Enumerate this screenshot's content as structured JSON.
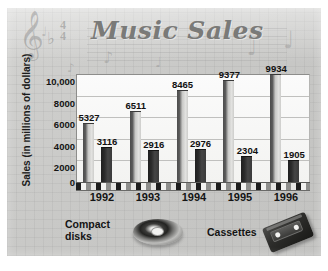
{
  "chart_data": {
    "type": "bar",
    "title": "Music Sales",
    "xlabel": "",
    "ylabel": "Sales (in millions of dollars)",
    "categories": [
      "1992",
      "1993",
      "1994",
      "1995",
      "1996"
    ],
    "series": [
      {
        "name": "Compact disks",
        "values": [
          5327,
          6511,
          8465,
          9377,
          9934
        ]
      },
      {
        "name": "Cassettes",
        "values": [
          3116,
          2916,
          2976,
          2304,
          1905
        ]
      }
    ],
    "ylim": [
      0,
      10000
    ],
    "yticks": [
      "10,000",
      "8000",
      "6000",
      "4000",
      "2000",
      "0"
    ],
    "ytick_values": [
      10000,
      8000,
      6000,
      4000,
      2000,
      0
    ],
    "grid": true,
    "legend_position": "bottom",
    "data_labels": true
  },
  "title_zone": {
    "title": "Music Sales",
    "clef_glyph": "𝄞",
    "flat_glyph": "♭",
    "time_signature_top": "4",
    "time_signature_bottom": "4",
    "decor_notes": [
      "♩",
      "♪",
      "♩",
      "♩",
      "♩",
      "♪"
    ]
  },
  "axis": {
    "y_title": "Sales (in millions of dollars)",
    "y_ticks": [
      "10,000",
      "8000",
      "6000",
      "4000",
      "2000",
      "0"
    ],
    "x_labels": [
      "1992",
      "1993",
      "1994",
      "1995",
      "1996"
    ]
  },
  "legend": {
    "compact_disks_label": "Compact\ndisks",
    "compact_disks_line1": "Compact",
    "compact_disks_line2": "disks",
    "cassettes_label": "Cassettes"
  },
  "bar_labels": {
    "cd": [
      "5327",
      "6511",
      "8465",
      "9377",
      "9934"
    ],
    "cassette": [
      "3116",
      "2916",
      "2976",
      "2304",
      "1905"
    ]
  },
  "colors": {
    "card_background": "#c9c9c7",
    "plot_background": "#f7f7f5",
    "gridline": "#c0c0be",
    "cd_bar": "#d0d0ce",
    "cassette_bar": "#2a2a2a",
    "text": "#141414",
    "title_text": "#7a7a78"
  }
}
